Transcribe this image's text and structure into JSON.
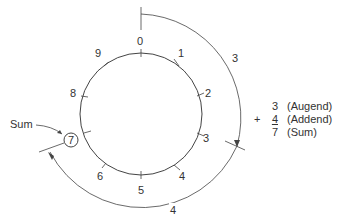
{
  "diagram": {
    "wheel_numbers": [
      "0",
      "1",
      "2",
      "3",
      "4",
      "5",
      "6",
      "7",
      "8",
      "9"
    ],
    "arc_labels": {
      "augend_arc": "3",
      "addend_arc": "4"
    },
    "sum_callout": "Sum",
    "sum_value": "7",
    "equation": {
      "augend": "3",
      "augend_label": "(Augend)",
      "operator": "+",
      "addend": "4",
      "addend_label": "(Addend)",
      "sum": "7",
      "sum_label": "(Sum)"
    },
    "colors": {
      "line": "#444444",
      "text": "#333333",
      "background": "#ffffff"
    }
  }
}
